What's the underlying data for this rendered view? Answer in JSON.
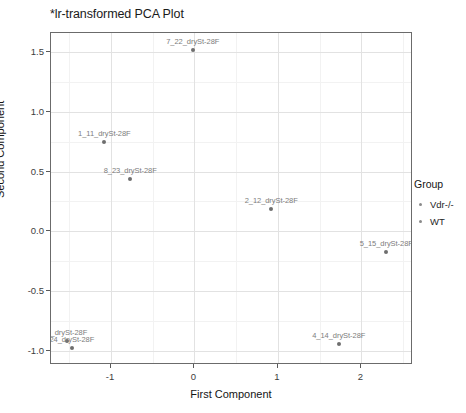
{
  "chart_data": {
    "type": "scatter",
    "title": "*lr-transformed PCA Plot",
    "xlabel": "First Component",
    "ylabel": "Second Component",
    "xlim": [
      -1.72,
      2.62
    ],
    "ylim": [
      -1.12,
      1.66
    ],
    "xticks": [
      "-1",
      "0",
      "1",
      "2"
    ],
    "xtick_values": [
      -1,
      0,
      1,
      2
    ],
    "yticks": [
      "1.5",
      "1.0",
      "0.5",
      "0.0",
      "-0.5",
      "-1.0"
    ],
    "ytick_values": [
      1.5,
      1.0,
      0.5,
      0.0,
      -0.5,
      -1.0
    ],
    "grid": true,
    "legend_position": "right",
    "point_color": "#6e6e6e",
    "label_color": "#7d7d7d",
    "panel_border_color": "#6b6b6b",
    "gridline_color": "#e2e2e2",
    "points": [
      {
        "label": "7_22_dryS​t-28F",
        "x": -0.02,
        "y": 1.52
      },
      {
        "label": "1_11_dryS​t-28F",
        "x": -1.08,
        "y": 0.75
      },
      {
        "label": "8_23_dryS​t-28F",
        "x": -0.77,
        "y": 0.44
      },
      {
        "label": "2_12_dryS​t-28F",
        "x": 0.92,
        "y": 0.19
      },
      {
        "label": "5_15_dryS​t-28F",
        "x": 2.3,
        "y": -0.17
      },
      {
        "label": "3_dryS​t-28F",
        "x": -1.53,
        "y": -0.92
      },
      {
        "label": "24_dryS​t-28F",
        "x": -1.47,
        "y": -0.98
      },
      {
        "label": "4_14_dryS​t-28F",
        "x": 1.73,
        "y": -0.94
      }
    ]
  },
  "legend": {
    "title": "Group",
    "items": [
      {
        "label": "Vdr-/-"
      },
      {
        "label": "WT"
      }
    ]
  }
}
